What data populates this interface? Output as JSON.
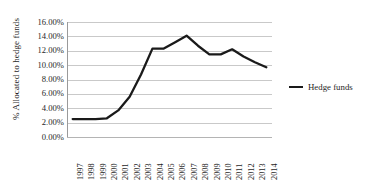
{
  "chart_data": {
    "type": "line",
    "title": "",
    "xlabel": "",
    "ylabel": "% Allocated to hedge funds",
    "ylim": [
      0,
      16
    ],
    "ytick_labels": [
      "16.00%",
      "14.00%",
      "12.00%",
      "10.00%",
      "8.00%",
      "6.00%",
      "4.00%",
      "2.00%",
      "0.00%"
    ],
    "ytick_values": [
      16,
      14,
      12,
      10,
      8,
      6,
      4,
      2,
      0
    ],
    "grid": true,
    "legend_position": "right",
    "categories": [
      "1997",
      "1998",
      "1999",
      "2000",
      "2001",
      "2002",
      "2003",
      "2004",
      "2005",
      "2006",
      "2007",
      "2008",
      "2009",
      "2010",
      "2011",
      "2012",
      "2013",
      "2014"
    ],
    "series": [
      {
        "name": "Hedge funds",
        "color": "#1a1a1a",
        "values": [
          2.5,
          2.5,
          2.5,
          2.6,
          3.7,
          5.6,
          8.7,
          12.3,
          12.3,
          13.2,
          14.1,
          12.7,
          11.5,
          11.5,
          12.2,
          11.2,
          10.4,
          9.7
        ]
      }
    ]
  },
  "legend": {
    "entries": [
      {
        "label": "Hedge funds",
        "marker": "line-swatch"
      }
    ]
  }
}
